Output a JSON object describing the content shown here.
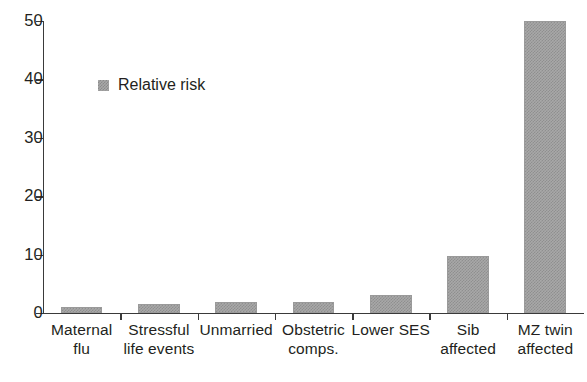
{
  "chart_data": {
    "type": "bar",
    "title": "",
    "subtitle": "",
    "xlabel": "",
    "ylabel": "",
    "ylim": [
      0,
      50
    ],
    "yticks": [
      0,
      10,
      20,
      30,
      40,
      50
    ],
    "ytick_labels": [
      "0",
      "10",
      "20",
      "30",
      "40",
      "50"
    ],
    "grid": false,
    "legend_position": "inside-upper-left",
    "categories": [
      "Maternal flu",
      "Stressful life events",
      "Unmarried",
      "Obstetric comps.",
      "Lower SES",
      "Sib affected",
      "MZ twin affected"
    ],
    "category_lines": [
      [
        "Maternal",
        "flu"
      ],
      [
        "Stressful",
        "life events"
      ],
      [
        "Unmarried",
        ""
      ],
      [
        "Obstetric",
        "comps."
      ],
      [
        "Lower SES",
        ""
      ],
      [
        "Sib",
        "affected"
      ],
      [
        "MZ twin",
        "affected"
      ]
    ],
    "series": [
      {
        "name": "Relative risk",
        "values": [
          1.0,
          1.5,
          1.9,
          1.9,
          3.0,
          9.7,
          50.0
        ]
      }
    ],
    "bar_color": "#a8a8a8",
    "axis_color": "#3a3a3a",
    "text_color": "#231f20"
  },
  "legend": {
    "label": "Relative risk",
    "swatch_icon": "filled-square-icon"
  }
}
